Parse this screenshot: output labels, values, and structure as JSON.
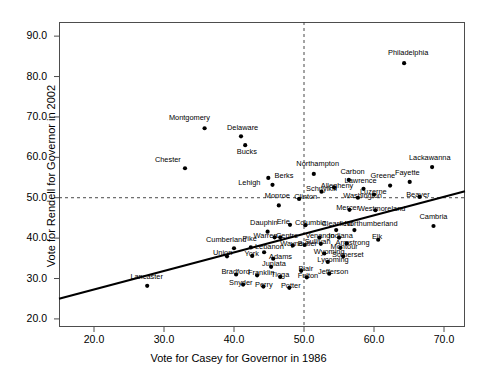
{
  "chart_data": {
    "type": "scatter",
    "title": "",
    "xlabel": "Vote for Casey for Governor in 1986",
    "ylabel": "Vote for Rendell for Governor in 2002",
    "xlim": [
      15.0,
      73.0
    ],
    "ylim": [
      18.0,
      93.5
    ],
    "xticks": [
      "20.0",
      "30.0",
      "40.0",
      "50.0",
      "60.0",
      "70.0"
    ],
    "xtick_values": [
      20.0,
      30.0,
      40.0,
      50.0,
      60.0,
      70.0
    ],
    "yticks": [
      "20.0",
      "30.0",
      "40.0",
      "50.0",
      "60.0",
      "70.0",
      "80.0",
      "90.0"
    ],
    "ytick_values": [
      20.0,
      30.0,
      40.0,
      50.0,
      60.0,
      70.0,
      80.0,
      90.0
    ],
    "grid": false,
    "reference_lines": [
      {
        "name": "vertical-50-reference",
        "orientation": "vertical",
        "value": 50.0,
        "style": "dashed"
      },
      {
        "name": "horizontal-50-reference",
        "orientation": "horizontal",
        "value": 50.0,
        "style": "dashed"
      }
    ],
    "fit_line": {
      "name": "regression-line",
      "x_start": 15.0,
      "y_start": 25.0,
      "x_end": 73.0,
      "y_end": 51.6,
      "style": "solid",
      "color": "#000000"
    },
    "marker_color": "#000000",
    "points": [
      {
        "label": "Montgomery",
        "x": 35.8,
        "y": 67.2,
        "lx": 30.7,
        "ly": 69.4
      },
      {
        "label": "Delaware",
        "x": 41.0,
        "y": 65.2,
        "lx": 39.0,
        "ly": 67.1
      },
      {
        "label": "Bucks",
        "x": 41.6,
        "y": 63.0,
        "lx": 40.4,
        "ly": 61.0
      },
      {
        "label": "Chester",
        "x": 33.0,
        "y": 57.3,
        "lx": 28.7,
        "ly": 59.2
      },
      {
        "label": "Berks",
        "x": 44.9,
        "y": 54.9,
        "lx": 45.8,
        "ly": 55.1
      },
      {
        "label": "Lehigh",
        "x": 45.5,
        "y": 53.2,
        "lx": 40.6,
        "ly": 53.4
      },
      {
        "label": "Northampton",
        "x": 51.4,
        "y": 55.9,
        "lx": 48.9,
        "ly": 58.0
      },
      {
        "label": "Carbon",
        "x": 56.4,
        "y": 54.4,
        "lx": 55.2,
        "ly": 56.2
      },
      {
        "label": "Lackawanna",
        "x": 68.3,
        "y": 57.6,
        "lx": 65.0,
        "ly": 59.5
      },
      {
        "label": "Fayette",
        "x": 65.1,
        "y": 53.9,
        "lx": 63.0,
        "ly": 55.9
      },
      {
        "label": "Greene",
        "x": 62.3,
        "y": 53.0,
        "lx": 59.5,
        "ly": 55.1
      },
      {
        "label": "Lawrence",
        "x": 58.5,
        "y": 52.2,
        "lx": 55.8,
        "ly": 54.0
      },
      {
        "label": "Allegheny",
        "x": 54.3,
        "y": 52.6,
        "lx": 52.4,
        "ly": 52.7
      },
      {
        "label": "Schuylkill",
        "x": 52.5,
        "y": 51.5,
        "lx": 50.3,
        "ly": 51.8
      },
      {
        "label": "Luzerne",
        "x": 60.0,
        "y": 50.8,
        "lx": 58.0,
        "ly": 51.2
      },
      {
        "label": "Washington",
        "x": 57.7,
        "y": 50.0,
        "lx": 55.6,
        "ly": 50.3
      },
      {
        "label": "Beaver",
        "x": 66.5,
        "y": 50.2,
        "lx": 64.6,
        "ly": 50.4
      },
      {
        "label": "Clinton",
        "x": 49.3,
        "y": 49.7,
        "lx": 48.6,
        "ly": 50.0
      },
      {
        "label": "Monroe",
        "x": 46.4,
        "y": 48.1,
        "lx": 44.4,
        "ly": 50.1
      },
      {
        "label": "Mercer",
        "x": 56.5,
        "y": 47.0,
        "lx": 54.6,
        "ly": 47.3
      },
      {
        "label": "Westmoreland",
        "x": 60.2,
        "y": 46.9,
        "lx": 57.7,
        "ly": 47.0
      },
      {
        "label": "Philadelphia",
        "x": 64.3,
        "y": 83.3,
        "lx": 62.0,
        "ly": 85.5
      },
      {
        "label": "Cambria",
        "x": 68.5,
        "y": 43.0,
        "lx": 66.5,
        "ly": 45.1
      },
      {
        "label": "Erie",
        "x": 48.0,
        "y": 43.3,
        "lx": 46.1,
        "ly": 43.7
      },
      {
        "label": "Columbia",
        "x": 50.2,
        "y": 43.2,
        "lx": 48.7,
        "ly": 43.5
      },
      {
        "label": "Clearfield",
        "x": 54.6,
        "y": 42.0,
        "lx": 52.5,
        "ly": 43.2
      },
      {
        "label": "Northumberland",
        "x": 57.2,
        "y": 42.0,
        "lx": 55.8,
        "ly": 43.2
      },
      {
        "label": "Dauphin",
        "x": 44.8,
        "y": 41.6,
        "lx": 42.3,
        "ly": 43.4
      },
      {
        "label": "Warren",
        "x": 45.8,
        "y": 40.2,
        "lx": 42.8,
        "ly": 40.4
      },
      {
        "label": "Centre",
        "x": 46.6,
        "y": 40.2,
        "lx": 46.0,
        "ly": 40.4
      },
      {
        "label": "Venango",
        "x": 52.2,
        "y": 40.1,
        "lx": 50.2,
        "ly": 40.4
      },
      {
        "label": "Indiana",
        "x": 55.0,
        "y": 40.1,
        "lx": 53.5,
        "ly": 40.4
      },
      {
        "label": "Elk",
        "x": 60.6,
        "y": 39.6,
        "lx": 59.7,
        "ly": 40.0
      },
      {
        "label": "Armstrong",
        "x": 56.1,
        "y": 38.7,
        "lx": 54.5,
        "ly": 38.6
      },
      {
        "label": "Montour",
        "x": 55.2,
        "y": 37.6,
        "lx": 53.8,
        "ly": 37.5
      },
      {
        "label": "Somerset",
        "x": 55.6,
        "y": 35.5,
        "lx": 54.0,
        "ly": 35.6
      },
      {
        "label": "Cumberland",
        "x": 40.0,
        "y": 37.5,
        "lx": 36.0,
        "ly": 39.4
      },
      {
        "label": "Pike",
        "x": 42.4,
        "y": 37.7,
        "lx": 41.2,
        "ly": 39.5
      },
      {
        "label": "Sullivan",
        "x": 52.4,
        "y": 38.6,
        "lx": 50.1,
        "ly": 38.7
      },
      {
        "label": "Wayne",
        "x": 48.4,
        "y": 38.2,
        "lx": 46.6,
        "ly": 38.3
      },
      {
        "label": "Butler",
        "x": 50.1,
        "y": 38.3,
        "lx": 49.1,
        "ly": 38.4
      },
      {
        "label": "Union",
        "x": 39.0,
        "y": 35.5,
        "lx": 37.0,
        "ly": 36.0
      },
      {
        "label": "Lebanon",
        "x": 44.3,
        "y": 36.5,
        "lx": 43.0,
        "ly": 37.5
      },
      {
        "label": "York",
        "x": 42.6,
        "y": 35.6,
        "lx": 41.5,
        "ly": 35.9
      },
      {
        "label": "Adams",
        "x": 45.6,
        "y": 34.9,
        "lx": 45.0,
        "ly": 35.2
      },
      {
        "label": "Wyoming",
        "x": 52.9,
        "y": 36.2,
        "lx": 51.4,
        "ly": 36.3
      },
      {
        "label": "Lycoming",
        "x": 53.4,
        "y": 34.1,
        "lx": 51.9,
        "ly": 34.3
      },
      {
        "label": "Juniata",
        "x": 45.3,
        "y": 32.9,
        "lx": 44.0,
        "ly": 33.3
      },
      {
        "label": "Blair",
        "x": 49.6,
        "y": 31.9,
        "lx": 49.2,
        "ly": 32.2
      },
      {
        "label": "Jefferson",
        "x": 53.6,
        "y": 31.2,
        "lx": 52.0,
        "ly": 31.3
      },
      {
        "label": "Bradford",
        "x": 40.3,
        "y": 31.0,
        "lx": 38.2,
        "ly": 31.3
      },
      {
        "label": "Franklin",
        "x": 43.3,
        "y": 30.8,
        "lx": 42.0,
        "ly": 31.0
      },
      {
        "label": "Tioga",
        "x": 46.6,
        "y": 30.4,
        "lx": 45.3,
        "ly": 30.6
      },
      {
        "label": "Fulton",
        "x": 50.4,
        "y": 30.3,
        "lx": 49.1,
        "ly": 30.4
      },
      {
        "label": "Lancaster",
        "x": 27.6,
        "y": 28.2,
        "lx": 25.2,
        "ly": 30.1
      },
      {
        "label": "Snyder",
        "x": 41.3,
        "y": 28.5,
        "lx": 39.3,
        "ly": 28.7
      },
      {
        "label": "Perry",
        "x": 44.2,
        "y": 28.0,
        "lx": 43.0,
        "ly": 28.2
      },
      {
        "label": "Potter",
        "x": 47.9,
        "y": 27.7,
        "lx": 46.7,
        "ly": 27.9
      }
    ]
  },
  "axis": {
    "x_title": "Vote for Casey for Governor in 1986",
    "y_title": "Vote for Rendell for Governor in 2002"
  }
}
